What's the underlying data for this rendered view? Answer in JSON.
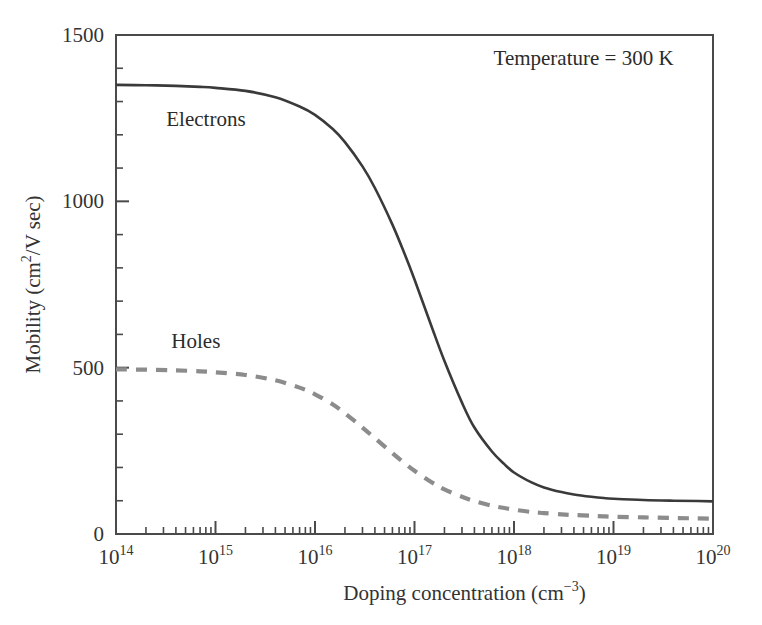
{
  "chart_data": {
    "type": "line",
    "title": "",
    "xlabel": "Doping concentration (cm−3)",
    "xlabel_base": "Doping concentration (cm",
    "xlabel_sup": "−3",
    "xlabel_tail": ")",
    "ylabel": "Mobility (cm2/V sec)",
    "ylabel_base": "Mobility (cm",
    "ylabel_sup": "2",
    "ylabel_tail": "/V sec)",
    "xscale": "log",
    "yscale": "linear",
    "xlim": [
      100000000000000.0,
      1e+20
    ],
    "ylim": [
      0,
      1500
    ],
    "grid": false,
    "legend": "inline-labels",
    "x_ticks": [
      {
        "value": 100000000000000.0,
        "mantissa": "10",
        "exponent": "14"
      },
      {
        "value": 1000000000000000.0,
        "mantissa": "10",
        "exponent": "15"
      },
      {
        "value": 1e+16,
        "mantissa": "10",
        "exponent": "16"
      },
      {
        "value": 1e+17,
        "mantissa": "10",
        "exponent": "17"
      },
      {
        "value": 1e+18,
        "mantissa": "10",
        "exponent": "18"
      },
      {
        "value": 1e+19,
        "mantissa": "10",
        "exponent": "19"
      },
      {
        "value": 1e+20,
        "mantissa": "10",
        "exponent": "20"
      }
    ],
    "y_ticks": [
      {
        "value": 0,
        "label": "0"
      },
      {
        "value": 500,
        "label": "500"
      },
      {
        "value": 1000,
        "label": "1000"
      },
      {
        "value": 1500,
        "label": "1500"
      }
    ],
    "y_minor_step": 100,
    "annotations": [
      {
        "name": "temperature",
        "text": "Temperature = 300 K",
        "x": 5e+18,
        "y": 1410
      }
    ],
    "series": [
      {
        "name": "Electrons",
        "label": "Electrons",
        "color": "#3a3a3a",
        "style": "solid",
        "width": 2.6,
        "label_x": 320000000000000.0,
        "label_y": 1225,
        "points": [
          [
            100000000000000.0,
            1350
          ],
          [
            200000000000000.0,
            1349
          ],
          [
            400000000000000.0,
            1347
          ],
          [
            700000000000000.0,
            1344
          ],
          [
            1000000000000000.0,
            1341
          ],
          [
            2000000000000000.0,
            1332
          ],
          [
            4000000000000000.0,
            1313
          ],
          [
            7000000000000000.0,
            1285
          ],
          [
            1e+16,
            1260
          ],
          [
            1.5e+16,
            1218
          ],
          [
            2e+16,
            1178
          ],
          [
            3e+16,
            1105
          ],
          [
            4e+16,
            1040
          ],
          [
            6e+16,
            930
          ],
          [
            8e+16,
            840
          ],
          [
            1e+17,
            765
          ],
          [
            1.5e+17,
            620
          ],
          [
            2e+17,
            520
          ],
          [
            3e+17,
            395
          ],
          [
            4e+17,
            320
          ],
          [
            6e+17,
            248
          ],
          [
            8e+17,
            210
          ],
          [
            1e+18,
            185
          ],
          [
            1.5e+18,
            155
          ],
          [
            2e+18,
            140
          ],
          [
            3e+18,
            126
          ],
          [
            4e+18,
            119
          ],
          [
            6e+18,
            112
          ],
          [
            8e+18,
            108
          ],
          [
            1e+19,
            106
          ],
          [
            2e+19,
            102
          ],
          [
            4e+19,
            100
          ],
          [
            7e+19,
            99
          ],
          [
            1e+20,
            98
          ]
        ]
      },
      {
        "name": "Holes",
        "label": "Holes",
        "color": "#8c8c8c",
        "style": "dashed",
        "width": 4.2,
        "dash": "11,9",
        "label_x": 360000000000000.0,
        "label_y": 560,
        "points": [
          [
            100000000000000.0,
            495
          ],
          [
            200000000000000.0,
            494
          ],
          [
            400000000000000.0,
            492
          ],
          [
            700000000000000.0,
            489
          ],
          [
            1000000000000000.0,
            486
          ],
          [
            2000000000000000.0,
            478
          ],
          [
            4000000000000000.0,
            462
          ],
          [
            7000000000000000.0,
            440
          ],
          [
            1e+16,
            420
          ],
          [
            1.5e+16,
            390
          ],
          [
            2e+16,
            363
          ],
          [
            3e+16,
            320
          ],
          [
            4e+16,
            288
          ],
          [
            6e+16,
            243
          ],
          [
            8e+16,
            212
          ],
          [
            1e+17,
            190
          ],
          [
            1.5e+17,
            155
          ],
          [
            2e+17,
            134
          ],
          [
            3e+17,
            112
          ],
          [
            4e+17,
            99
          ],
          [
            6e+17,
            85
          ],
          [
            8e+17,
            78
          ],
          [
            1e+18,
            73
          ],
          [
            1.5e+18,
            66
          ],
          [
            2e+18,
            63
          ],
          [
            3e+18,
            59
          ],
          [
            4e+18,
            57
          ],
          [
            6e+18,
            55
          ],
          [
            8e+18,
            53
          ],
          [
            1e+19,
            52
          ],
          [
            2e+19,
            50
          ],
          [
            4e+19,
            48
          ],
          [
            7e+19,
            47
          ],
          [
            1e+20,
            46
          ]
        ]
      }
    ]
  },
  "figure": {
    "background": "#ffffff",
    "axis_color": "#4a4a4a"
  }
}
